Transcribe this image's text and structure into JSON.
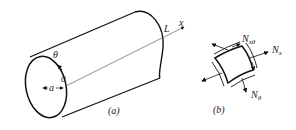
{
  "figure": {
    "panel_a": {
      "caption": "(a)",
      "labels": {
        "axis": "x",
        "length": "L",
        "angle": "θ",
        "origin": "0",
        "radius": "a"
      }
    },
    "panel_b": {
      "caption": "(b)",
      "labels": {
        "shear": "N",
        "shear_sub": "xθ",
        "axial": "N",
        "axial_sub": "x",
        "hoop": "N",
        "hoop_sub": "θ"
      }
    }
  }
}
